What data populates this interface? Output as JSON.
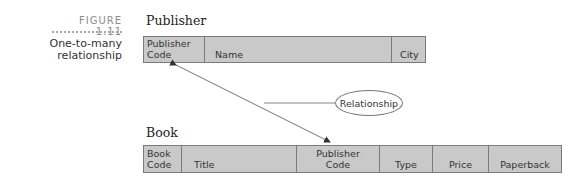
{
  "figure": {
    "number": "FIGURE 1.11",
    "caption": "One-to-many\nrelationship"
  },
  "publisher": {
    "title": "Publisher",
    "columns": [
      {
        "label": "Publisher\nCode"
      },
      {
        "label": "Name"
      },
      {
        "label": "City"
      }
    ]
  },
  "book": {
    "title": "Book",
    "columns": [
      {
        "label": "Book\nCode"
      },
      {
        "label": "Title"
      },
      {
        "label": "Publisher\nCode"
      },
      {
        "label": "Type"
      },
      {
        "label": "Price"
      },
      {
        "label": "Paperback"
      }
    ]
  },
  "relationship": {
    "label": "Relationship",
    "from": "Publisher.Publisher Code",
    "to": "Book.Publisher Code"
  },
  "colors": {
    "table_fill": "#c9c9c9",
    "table_border": "#7a7a7a",
    "figure_label": "#8c8c8c"
  }
}
